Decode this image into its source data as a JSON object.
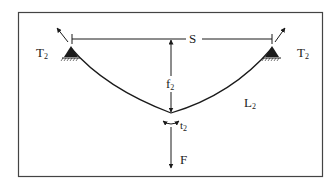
{
  "diagram": {
    "type": "cable-sag-free-body",
    "labels": {
      "span": "S",
      "tension_left": "T",
      "tension_left_sub": "2",
      "tension_right": "T",
      "tension_right_sub": "2",
      "sag": "f",
      "sag_sub": "2",
      "cable_length": "L",
      "cable_length_sub": "2",
      "angle": "t",
      "angle_sub": "2",
      "force": "F"
    },
    "colors": {
      "line": "#1a1a1a",
      "frame": "#444444",
      "background": "#ffffff"
    }
  }
}
